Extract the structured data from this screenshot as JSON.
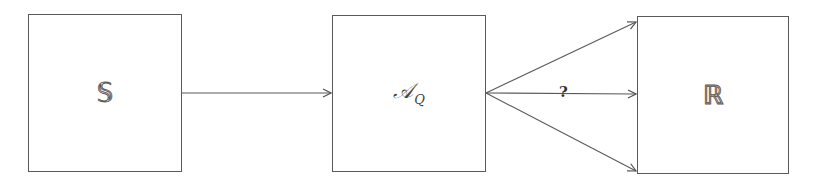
{
  "diagram": {
    "nodes": [
      {
        "id": "S",
        "label": "𝕊",
        "x": 28,
        "y": 14,
        "w": 153,
        "h": 157
      },
      {
        "id": "AQ",
        "label": "𝒜",
        "subscript": "Q",
        "x": 332,
        "y": 15,
        "w": 154,
        "h": 157
      },
      {
        "id": "R",
        "label": "ℝ",
        "x": 637,
        "y": 16,
        "w": 152,
        "h": 157
      }
    ],
    "edges": [
      {
        "from": "S",
        "to": "AQ",
        "label": ""
      },
      {
        "from": "AQ",
        "to": "R",
        "target_point": "top",
        "label": ""
      },
      {
        "from": "AQ",
        "to": "R",
        "target_point": "middle",
        "label": "?"
      },
      {
        "from": "AQ",
        "to": "R",
        "target_point": "bottom",
        "label": ""
      }
    ],
    "edge_label": "?",
    "colors": {
      "stroke": "#5a5a5a",
      "text": "#444444",
      "background": "#ffffff"
    }
  }
}
